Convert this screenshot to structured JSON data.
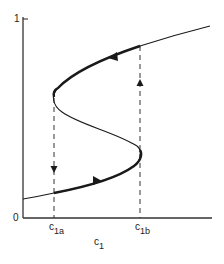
{
  "diagram": {
    "type": "hysteresis-s-curve",
    "y_axis": {
      "top_label": "1",
      "bottom_label": "0"
    },
    "x_axis": {
      "label_main": "c",
      "label_sub": "1",
      "ticks": [
        {
          "main": "c",
          "sub": "1a"
        },
        {
          "main": "c",
          "sub": "1b"
        }
      ]
    },
    "colors": {
      "line": "#1a1a1a",
      "axis": "#333333",
      "dashed": "#333333",
      "background": "#ffffff"
    },
    "annotations": {
      "lower_branch_arrow": "right",
      "upper_branch_arrow": "left",
      "jump_down_at": "c1a",
      "jump_up_at": "c1b"
    }
  }
}
